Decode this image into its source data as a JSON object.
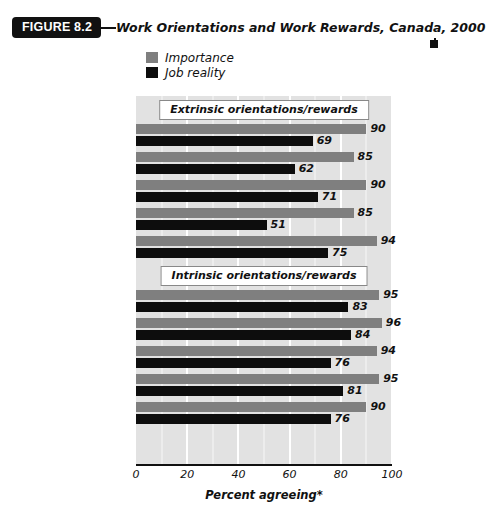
{
  "figure": {
    "badge": "FIGURE 8.2",
    "title": "Work Orientations and Work Rewards, Canada, 2000"
  },
  "legend": {
    "items": [
      {
        "label": "Importance",
        "color": "#7f7f7f",
        "swatch_name": "legend-swatch-importance"
      },
      {
        "label": "Job reality",
        "color": "#0d0d0d",
        "swatch_name": "legend-swatch-job-reality"
      }
    ]
  },
  "chart_data": {
    "type": "bar",
    "orientation": "horizontal",
    "title": "Work Orientations and Work Rewards, Canada, 2000",
    "xlabel": "Percent agreeing*",
    "ylabel": "",
    "xlim": [
      0,
      100
    ],
    "xticks": [
      0,
      20,
      40,
      60,
      80,
      100
    ],
    "grid": true,
    "legend_position": "top-left",
    "series": [
      {
        "name": "Importance",
        "color": "#7f7f7f",
        "values": [
          90,
          85,
          90,
          85,
          94,
          95,
          96,
          94,
          95,
          90
        ]
      },
      {
        "name": "Job reality",
        "color": "#0d0d0d",
        "values": [
          69,
          62,
          71,
          51,
          75,
          83,
          84,
          76,
          81,
          76
        ]
      }
    ],
    "categories": [
      "Pays well",
      "Good benefits",
      "Job security",
      "Career advancement",
      "Balance work and family",
      "Interesting work",
      "Sense of accomplishment",
      "Freedom to decide",
      "Develop skills and abilities",
      "Receive recognition"
    ],
    "groups": [
      {
        "header": "Extrinsic orientations/rewards",
        "rows": [
          {
            "label": "Pays well",
            "importance": 90,
            "reality": 69
          },
          {
            "label": "Good benefits",
            "importance": 85,
            "reality": 62
          },
          {
            "label": "Job security",
            "importance": 90,
            "reality": 71
          },
          {
            "label": "Career advancement",
            "importance": 85,
            "reality": 51
          },
          {
            "label": "Balance work and family",
            "importance": 94,
            "reality": 75
          }
        ]
      },
      {
        "header": "Intrinsic orientations/rewards",
        "rows": [
          {
            "label": "Interesting work",
            "importance": 95,
            "reality": 83
          },
          {
            "label": "Sense of accomplishment",
            "importance": 96,
            "reality": 84
          },
          {
            "label": "Freedom to decide",
            "importance": 94,
            "reality": 76
          },
          {
            "label": "Develop skills and abilities",
            "importance": 95,
            "reality": 81
          },
          {
            "label": "Receive recognition",
            "importance": 90,
            "reality": 76
          }
        ]
      }
    ]
  }
}
